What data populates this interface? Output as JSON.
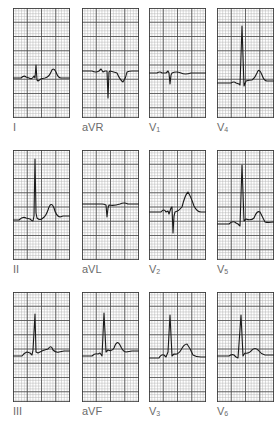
{
  "figure": {
    "title": "",
    "grid": {
      "minor_color": "#b5b5b5",
      "major_color": "#4a4a4a",
      "border_color": "#3a3a3a",
      "trace_color": "#1a1a1a",
      "minor_step": 2.85,
      "major_every": 5
    },
    "leads": [
      {
        "id": "I",
        "label": "I",
        "sub": "",
        "x": 13,
        "y": 8,
        "baseline": 70,
        "trace": "M0,70 L8,70 Q11,67 13,69 L16,70 Q19,72 21,68 L22,70 L23,57 L24,72 L25,73 Q28,70 32,70 Q36,69 38,64 Q40,58 43,64 Q45,70 48,70 L57,70"
      },
      {
        "id": "aVR",
        "label": "aVR",
        "sub": "",
        "x": 82,
        "y": 8,
        "baseline": 63,
        "trace": "M0,63 L10,63 Q14,65 17,63 L19,61 L21,64 L23,63 L25,63 L26,90 L27,64 L28,63 Q32,64 35,65 Q38,72 41,74 Q44,70 45,64 Q47,63 50,63 L57,63"
      },
      {
        "id": "V1",
        "label": "V",
        "sub": "1",
        "x": 149,
        "y": 8,
        "baseline": 65,
        "trace": "M0,65 L8,65 Q11,63 13,65 L17,65 L19,63 L20,65 L21,76 L22,67 L23,65 Q27,63 32,65 Q36,67 42,65 L57,65"
      },
      {
        "id": "V4",
        "label": "V",
        "sub": "4",
        "x": 217,
        "y": 8,
        "baseline": 75,
        "trace": "M0,75 L14,75 Q17,73 19,75 L22,76 L23,77 L25,18 L27,78 L29,73 Q32,72 35,72 Q38,70 40,65 Q42,59 45,67 Q47,73 50,73 L57,73"
      },
      {
        "id": "II",
        "label": "II",
        "sub": "",
        "x": 13,
        "y": 150,
        "baseline": 70,
        "trace": "M0,70 L6,70 Q10,66 13,68 L17,69 Q19,71 20,71 L21,66 L22,9 L23,63 L24,68 Q27,71 30,68 Q33,66 35,60 Q38,50 41,58 Q43,66 47,67 L50,66 L57,66"
      },
      {
        "id": "aVL",
        "label": "aVL",
        "sub": "",
        "x": 82,
        "y": 150,
        "baseline": 54,
        "trace": "M0,54 L20,54 Q22,54 24,55 L25,67 L26,58 L27,55 Q32,56 38,54 Q42,52 46,54 L57,54"
      },
      {
        "id": "V2",
        "label": "V",
        "sub": "2",
        "x": 149,
        "y": 150,
        "baseline": 62,
        "trace": "M0,62 L12,62 Q15,58 17,62 L19,61 L20,64 L22,58 L23,57 L24,83 L25,66 L26,62 Q30,61 33,57 Q36,45 39,42 Q42,47 45,56 Q48,62 52,62 L57,62"
      },
      {
        "id": "V5",
        "label": "V",
        "sub": "5",
        "x": 217,
        "y": 150,
        "baseline": 74,
        "trace": "M0,74 L12,74 Q16,70 19,73 L21,74 L23,76 L25,15 L27,71 L29,69 Q34,71 37,68 Q40,60 43,62 Q46,68 48,72 Q51,73 57,72"
      },
      {
        "id": "III",
        "label": "III",
        "sub": "",
        "x": 13,
        "y": 292,
        "baseline": 64,
        "trace": "M0,64 L9,64 Q11,61 14,60 L17,61 L19,63 L20,58 L22,22 L23,60 L25,61 Q30,58 35,57 Q38,52 40,58 Q43,61 46,60 L51,59 L57,59"
      },
      {
        "id": "aVF",
        "label": "aVF",
        "sub": "",
        "x": 82,
        "y": 292,
        "baseline": 64,
        "trace": "M0,64 L10,64 Q13,61 16,62 L18,61 L20,64 L22,21 L24,60 L26,58 Q30,60 32,56 Q35,47 38,53 Q41,60 44,60 L50,59 L57,59"
      },
      {
        "id": "V3",
        "label": "V",
        "sub": "3",
        "x": 149,
        "y": 292,
        "baseline": 66,
        "trace": "M0,66 L10,66 Q12,62 15,63 L17,65 L19,60 L21,23 L23,64 L25,62 Q29,63 32,58 Q35,52 38,52 Q41,56 44,63 Q47,65 52,65 L57,65"
      },
      {
        "id": "V6",
        "label": "V",
        "sub": "6",
        "x": 217,
        "y": 292,
        "baseline": 64,
        "trace": "M0,64 L12,64 Q15,62 17,63 L19,65 L21,66 L24,23 L26,64 L28,61 Q32,62 35,58 Q38,55 41,58 Q44,62 48,63 L57,63"
      }
    ],
    "label_offset_y": 114
  }
}
